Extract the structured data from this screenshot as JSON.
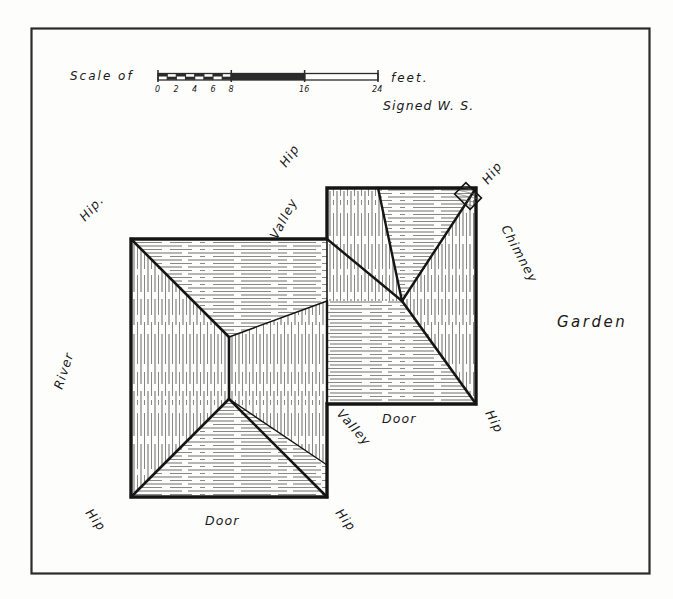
{
  "drawing": {
    "title": "Hipped roof plan with valley and chimney",
    "frame": {
      "stroke_color": "#2b2b2b"
    },
    "scale": {
      "prefix_label": "Scale of",
      "suffix_label": "feet.",
      "tick_labels": [
        "0",
        "2",
        "4",
        "6",
        "8",
        "16",
        "24"
      ],
      "tick_values": [
        0,
        2,
        4,
        6,
        8,
        16,
        24
      ],
      "max_value": 24
    },
    "signature": "Signed W. S.",
    "labels": [
      {
        "id": "hip-top-middle",
        "text": "Hip"
      },
      {
        "id": "valley-top-middle",
        "text": "Valley"
      },
      {
        "id": "hip-top-right",
        "text": "Hip"
      },
      {
        "id": "chimney",
        "text": "Chimney"
      },
      {
        "id": "garden",
        "text": "Garden"
      },
      {
        "id": "hip-top-left",
        "text": "Hip."
      },
      {
        "id": "river",
        "text": "River"
      },
      {
        "id": "valley-bottom-middle",
        "text": "Valley"
      },
      {
        "id": "door-right",
        "text": "Door"
      },
      {
        "id": "hip-bottom-right",
        "text": "Hip"
      },
      {
        "id": "hip-bottom-left",
        "text": "Hip"
      },
      {
        "id": "door-bottom",
        "text": "Door"
      },
      {
        "id": "hip-bottom-centre-right",
        "text": "Hip"
      }
    ],
    "features": {
      "chimney_note": "hatched chimney block at north-east hip apex",
      "roof_outline_note": "L-shaped hipped roof, two wings meeting at valleys",
      "line_color": "#151515",
      "hatch_color": "#6f6f6f"
    }
  }
}
